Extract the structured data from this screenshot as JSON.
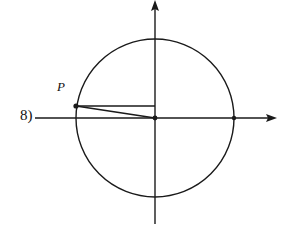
{
  "problem": {
    "number_label": "8)"
  },
  "diagram": {
    "type": "unit-circle",
    "center": [
      155,
      118
    ],
    "radius": 79,
    "stroke_color": "#1a1a1a",
    "background": "#ffffff",
    "x_axis": {
      "from": 35,
      "to": 276,
      "y": 118,
      "arrow": "right"
    },
    "y_axis": {
      "from": 224,
      "to": 1,
      "x": 155,
      "arrow": "up"
    },
    "points": [
      {
        "name": "P",
        "label": "P",
        "x": 76,
        "y": 106
      },
      {
        "name": "origin",
        "label": "",
        "x": 155,
        "y": 118
      },
      {
        "name": "positive-x-intercept",
        "label": "",
        "x": 234,
        "y": 118
      }
    ],
    "segments": [
      {
        "name": "horizontal-projection",
        "from": [
          76,
          106
        ],
        "to": [
          155,
          106
        ]
      },
      {
        "name": "radius-to-P",
        "from": [
          76,
          106
        ],
        "to": [
          155,
          118
        ]
      }
    ]
  }
}
